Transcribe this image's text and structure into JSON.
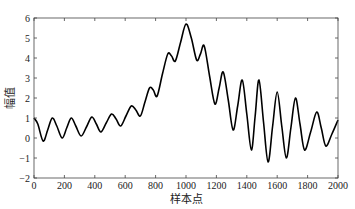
{
  "chart_data": {
    "type": "line",
    "title": "",
    "xlabel": "样本点",
    "ylabel": "幅值",
    "xlim": [
      0,
      2000
    ],
    "ylim": [
      -2,
      6
    ],
    "grid": false,
    "legend": null,
    "x_ticks": [
      0,
      200,
      400,
      600,
      800,
      1000,
      1200,
      1400,
      1600,
      1800,
      2000
    ],
    "y_ticks": [
      -2,
      -1,
      0,
      1,
      2,
      3,
      4,
      5,
      6
    ],
    "series": [
      {
        "name": "signal",
        "color": "#000000",
        "x": [
          0,
          25,
          60,
          90,
          120,
          150,
          185,
          215,
          245,
          275,
          310,
          345,
          380,
          410,
          440,
          475,
          510,
          540,
          570,
          605,
          640,
          670,
          700,
          730,
          760,
          785,
          810,
          845,
          880,
          905,
          930,
          965,
          1000,
          1035,
          1070,
          1095,
          1120,
          1155,
          1190,
          1218,
          1245,
          1278,
          1310,
          1340,
          1370,
          1400,
          1430,
          1455,
          1480,
          1510,
          1540,
          1570,
          1600,
          1630,
          1660,
          1690,
          1720,
          1750,
          1780,
          1820,
          1860,
          1890,
          1920,
          1960,
          2000
        ],
        "y": [
          1.0,
          0.7,
          -0.15,
          0.4,
          1.0,
          0.6,
          0.0,
          0.5,
          1.0,
          0.6,
          0.1,
          0.55,
          1.05,
          0.7,
          0.3,
          0.75,
          1.2,
          0.95,
          0.6,
          1.1,
          1.6,
          1.4,
          1.1,
          1.8,
          2.5,
          2.4,
          2.1,
          3.2,
          4.2,
          4.1,
          3.85,
          4.8,
          5.7,
          5.0,
          3.9,
          4.2,
          4.6,
          3.1,
          1.7,
          2.5,
          3.3,
          1.9,
          0.4,
          1.6,
          2.9,
          1.2,
          -0.6,
          1.1,
          2.9,
          0.8,
          -1.2,
          0.6,
          2.3,
          0.6,
          -1.0,
          0.5,
          2.0,
          0.7,
          -0.6,
          0.3,
          1.3,
          0.5,
          -0.4,
          0.2,
          0.9
        ]
      }
    ]
  }
}
